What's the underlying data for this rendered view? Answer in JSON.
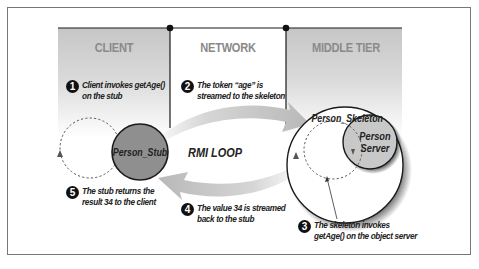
{
  "diagram": {
    "title": "RMI LOOP",
    "colors": {
      "panel_gray": "#c9c9c9",
      "arrow_gray": "#c4c4c4",
      "stub_fill": "#8f8f8f",
      "server_fill": "#c8c8c8",
      "line": "#1a1a1a",
      "heading_text": "#8a8a8a"
    },
    "columns": [
      {
        "id": "client",
        "label": "CLIENT"
      },
      {
        "id": "network",
        "label": "NETWORK"
      },
      {
        "id": "middle_tier",
        "label": "MIDDLE TIER"
      }
    ],
    "nodes": {
      "stub": "Person_Stub",
      "skeleton": "Person_Skeleton",
      "server_line1": "Person",
      "server_line2": "Server"
    },
    "center_label": "RMI LOOP",
    "steps": [
      {
        "n": "1",
        "line1": "Client invokes getAge()",
        "line2": "on the stub"
      },
      {
        "n": "2",
        "line1": "The token “age” is",
        "line2": "streamed to the skeleton"
      },
      {
        "n": "3",
        "line1": "The skeleton invokes",
        "line2": "getAge() on the object server"
      },
      {
        "n": "4",
        "line1": "The value 34 is streamed",
        "line2": "back to the stub"
      },
      {
        "n": "5",
        "line1": "The stub returns the",
        "line2": "result 34 to the client"
      }
    ]
  }
}
